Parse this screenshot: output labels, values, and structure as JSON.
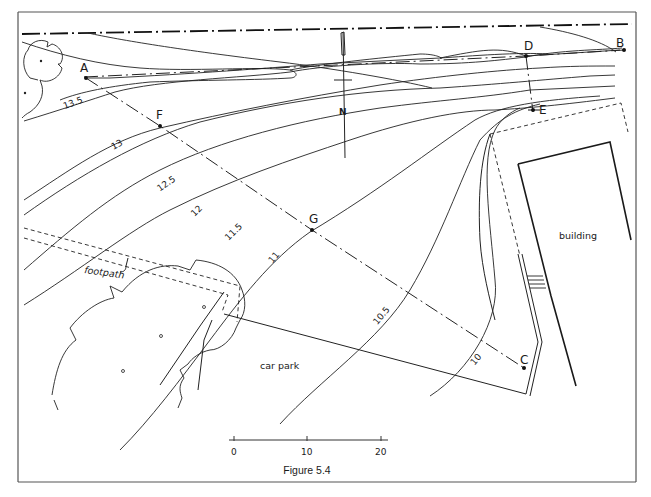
{
  "figure": {
    "caption": "Figure 5.4",
    "type": "site plan with contour lines",
    "colors": {
      "ink": "#1a1a1a",
      "frame": "#555555",
      "background": "#ffffff"
    }
  },
  "points": {
    "A": "A",
    "B": "B",
    "C": "C",
    "D": "D",
    "E": "E",
    "F": "F",
    "G": "G"
  },
  "contours": [
    "13.5",
    "13",
    "12.5",
    "12",
    "11.5",
    "11",
    "10.5",
    "10"
  ],
  "areas": {
    "building": "building",
    "car_park": "car park",
    "footpath": "footpath"
  },
  "north_arrow": {
    "label": "N"
  },
  "scale_bar": {
    "ticks": [
      "0",
      "10",
      "20"
    ]
  }
}
